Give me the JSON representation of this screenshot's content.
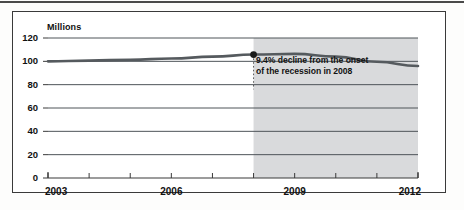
{
  "figure": {
    "background_color": "#ffffff",
    "frame_color": "#3a3a3a"
  },
  "chart_data": {
    "type": "line",
    "title": "",
    "subtitle": "",
    "xlabel": "",
    "ylabel": "Millions",
    "unit_label": "Millions",
    "xlim": [
      2003,
      2012
    ],
    "ylim": [
      0,
      120
    ],
    "grid": true,
    "grid_axis": "y",
    "legend": false,
    "legend_position": "none",
    "x_tick_labels": [
      "2003",
      "2006",
      "2009",
      "2012"
    ],
    "x_major_ticks": [
      2003,
      2006,
      2009,
      2012
    ],
    "x_minor_ticks": [
      2004,
      2005,
      2007,
      2008,
      2010,
      2011
    ],
    "y_tick_labels": [
      "0",
      "20",
      "40",
      "60",
      "80",
      "100",
      "120"
    ],
    "y_ticks": [
      0,
      20,
      40,
      60,
      80,
      100,
      120
    ],
    "line_color": "#555a5e",
    "marker_color": "#1a1a1a",
    "x": [
      2003,
      2004,
      2005,
      2006,
      2007,
      2008,
      2009,
      2010,
      2011,
      2012
    ],
    "series": [
      {
        "name": "Employment",
        "values": [
          100.0,
          100.6,
          101.4,
          102.4,
          104.0,
          105.8,
          106.4,
          104.0,
          99.6,
          96.0
        ]
      }
    ],
    "marker_points": [
      {
        "x": 2008,
        "y": 105.8,
        "label": "recession onset"
      }
    ],
    "shaded_regions": [
      {
        "name": "recession",
        "x_start": 2008,
        "x_end": 2012,
        "color": "#d2d4d6"
      }
    ],
    "annotations": [
      {
        "name": "recession-decline-note",
        "lines": [
          "9.4% decline from the onset",
          "of the recession in 2008"
        ],
        "x": 2008,
        "y": 98
      }
    ]
  }
}
